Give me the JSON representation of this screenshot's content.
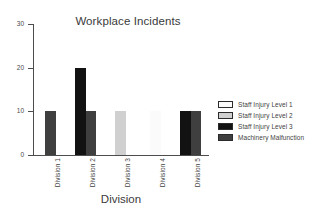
{
  "chart_data": {
    "type": "bar",
    "title": "Workplace Incidents",
    "xlabel": "Division",
    "ylabel": "",
    "categories": [
      "Division 1",
      "Division 2",
      "Division 3",
      "Division 4",
      "Division 5"
    ],
    "ylim": [
      0,
      30
    ],
    "yticks": [
      0,
      10,
      20,
      30
    ],
    "ytick_labels": [
      "0",
      "10",
      "20",
      "30"
    ],
    "grid": false,
    "legend_position": "right",
    "series": [
      {
        "name": "Staff Injury Level 1",
        "color": "#fbfbfb",
        "values": [
          0,
          0,
          0,
          10,
          0
        ]
      },
      {
        "name": "Staff Injury Level 2",
        "color": "#d0d0d0",
        "values": [
          0,
          0,
          10,
          0,
          0
        ]
      },
      {
        "name": "Staff Injury Level 3",
        "color": "#121212",
        "values": [
          0,
          20,
          0,
          0,
          10
        ]
      },
      {
        "name": "Machinery Malfunction",
        "color": "#3f3f3f",
        "values": [
          10,
          10,
          0,
          0,
          10
        ]
      }
    ]
  },
  "axis": {
    "line_color": "#4d4d4d"
  }
}
